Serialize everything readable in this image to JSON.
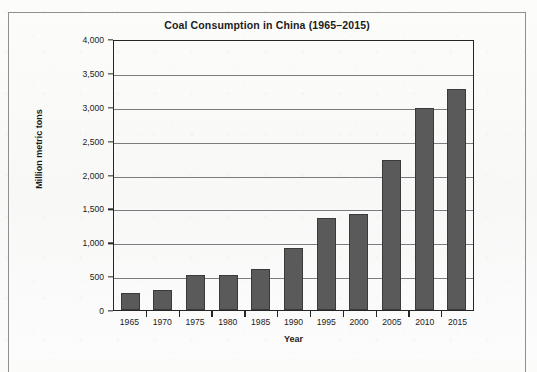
{
  "chart_data": {
    "type": "bar",
    "title": "Coal Consumption in China (1965–2015)",
    "xlabel": "Year",
    "ylabel": "Million metric tons",
    "categories": [
      "1965",
      "1970",
      "1975",
      "1980",
      "1985",
      "1990",
      "1995",
      "2000",
      "2005",
      "2010",
      "2015"
    ],
    "values": [
      250,
      300,
      510,
      510,
      600,
      915,
      1360,
      1410,
      2215,
      2985,
      3265
    ],
    "ylim": [
      0,
      4000
    ],
    "ytick_values": [
      0,
      500,
      1000,
      1500,
      2000,
      2500,
      3000,
      3500,
      4000
    ],
    "ytick_labels": [
      "0",
      "500",
      "1,000",
      "1,500",
      "2,000",
      "2,500",
      "3,000",
      "3,500",
      "4,000"
    ],
    "grid": true,
    "legend": "none",
    "bar_color": "#5a5a5a",
    "bar_edge_color": "#3a3a3a",
    "axis_color": "#262626",
    "gridline_color": "#7c7c80",
    "background_color": "#fbfbfa"
  }
}
